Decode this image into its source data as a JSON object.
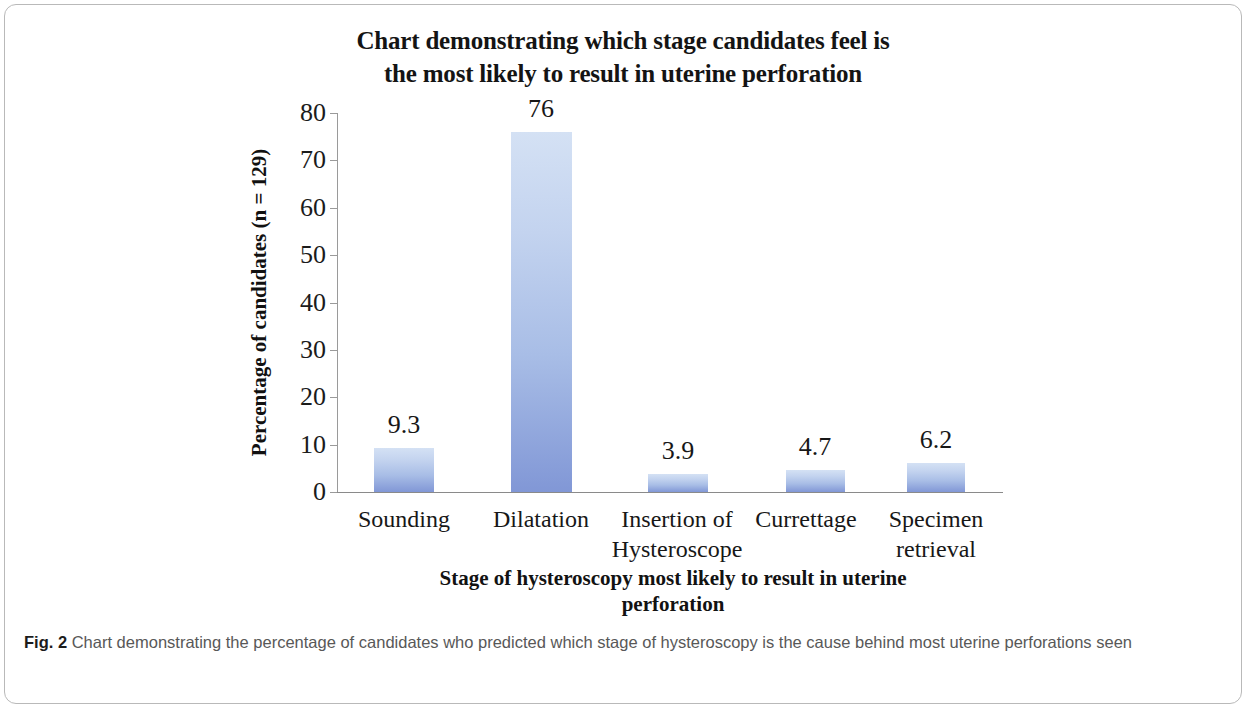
{
  "figure": {
    "caption_number": "Fig. 2",
    "caption_text": "Chart demonstrating the percentage of candidates who predicted which stage of hysteroscopy is the cause behind most uterine perforations seen"
  },
  "chart_data": {
    "type": "bar",
    "title": "Chart demonstrating which stage candidates feel is the most likely  to result in uterine perforation",
    "title_line1": "Chart demonstrating which stage candidates feel is",
    "title_line2": "the most likely  to result in uterine perforation",
    "categories": [
      "Sounding",
      "Insertion of Hysteroscope",
      "Dilatation",
      "Currettage",
      "Specimen retrieval"
    ],
    "category_display": [
      {
        "line1": "Sounding",
        "line2": ""
      },
      {
        "line1": "Dilatation",
        "line2": ""
      },
      {
        "line1": "Insertion of",
        "line2": "Hysteroscope"
      },
      {
        "line1": "Currettage",
        "line2": ""
      },
      {
        "line1": "Specimen",
        "line2": "retrieval"
      }
    ],
    "values": [
      9.3,
      76,
      3.9,
      4.7,
      6.2
    ],
    "value_labels": [
      "9.3",
      "76",
      "3.9",
      "4.7",
      "6.2"
    ],
    "xlabel": "Stage of hysteroscopy most likely to result in uterine perforation",
    "xlabel_line1": "Stage of hysteroscopy most likely to result in uterine",
    "xlabel_line2": "perforation",
    "ylabel": "Percentage of candidates (n = 129)",
    "ylim": [
      0,
      80
    ],
    "ytick_labels": [
      "80",
      "70",
      "60",
      "50",
      "40",
      "30",
      "20",
      "10",
      "0"
    ],
    "ytick_values": [
      80,
      70,
      60,
      50,
      40,
      30,
      20,
      10,
      0
    ],
    "grid": false,
    "legend": "none",
    "bar_color_top": "#d4e1f4",
    "bar_color_bottom": "#8197d6",
    "n": 129
  }
}
